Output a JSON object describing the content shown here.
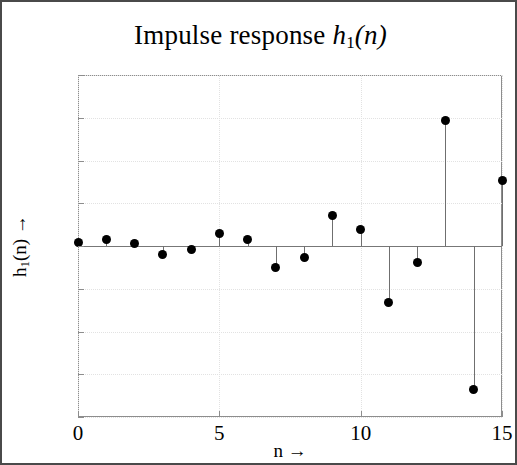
{
  "chart_data": {
    "type": "scatter",
    "subtype": "stem",
    "title_parts": {
      "prefix": "Impulse response ",
      "var": "h",
      "sub": "1",
      "arg": "(n)"
    },
    "xlabel": "n →",
    "ylabel": "h_1(n) →",
    "ylabel_parts": {
      "var": "h",
      "sub": "1",
      "rest": "(n) →"
    },
    "xlim": [
      0,
      15
    ],
    "ylim": [
      -0.8,
      0.8
    ],
    "xticks": [
      0,
      5,
      10,
      15
    ],
    "xtick_labels": [
      "0",
      "5",
      "10",
      "15"
    ],
    "yticks": [
      0.8,
      0.6,
      0.4,
      0.2,
      0,
      -0.2,
      -0.4,
      -0.6,
      -0.8
    ],
    "ytick_labels": [
      "0.8",
      "0.6",
      "0.4",
      "0.2",
      "0",
      "−0.2",
      "−0.4",
      "−0.6",
      "−0.8"
    ],
    "grid": true,
    "grid_style": "dotted",
    "legend": null,
    "marker_color": "#000000",
    "stem_color": "#6f6f6f",
    "x": [
      0,
      1,
      2,
      3,
      4,
      5,
      6,
      7,
      8,
      9,
      10,
      11,
      12,
      13,
      14,
      15
    ],
    "values": [
      0.015,
      0.03,
      0.01,
      -0.04,
      -0.015,
      0.06,
      0.03,
      -0.1,
      -0.055,
      0.145,
      0.075,
      -0.265,
      -0.075,
      0.585,
      -0.67,
      0.305
    ]
  }
}
